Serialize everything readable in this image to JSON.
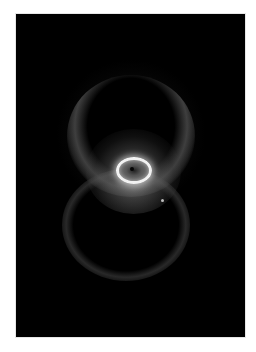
{
  "image": {
    "subject": "Hourglass nebula",
    "description": "Grayscale astronomical image of a bipolar planetary nebula with two ring-shaped lobes and a bright central elliptical ring, on a black field with white border",
    "colors": {
      "border": "#ffffff",
      "field": "#000000",
      "inner_ring": "#f2f2f2",
      "lobes": "#6e6e6e"
    }
  }
}
